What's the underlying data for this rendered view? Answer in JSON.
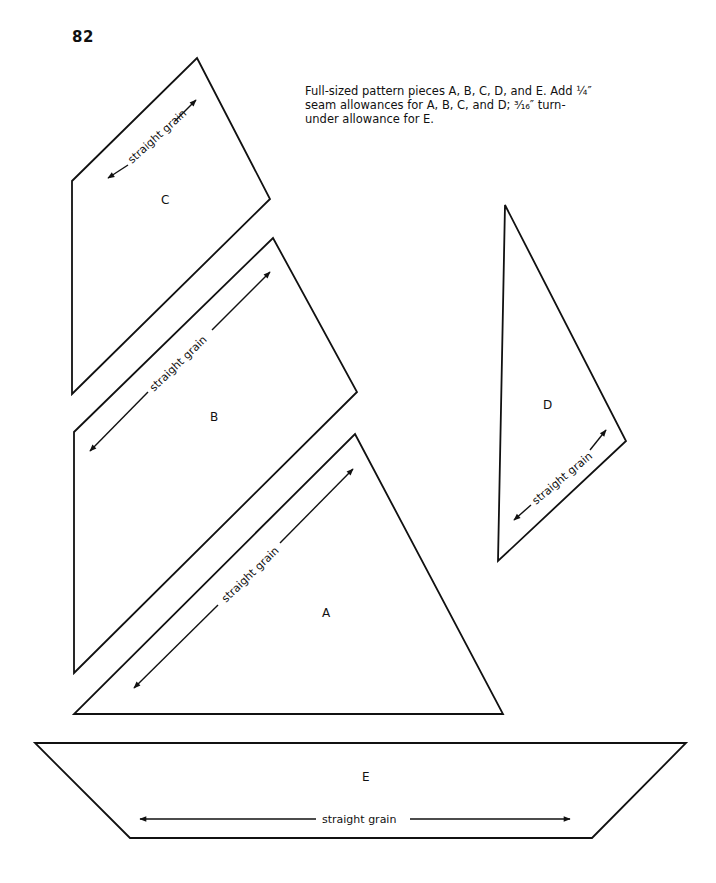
{
  "page": {
    "number": "82",
    "instructions": "Full-sized pattern pieces A, B, C, D, and E. Add ¼″ seam allowances for A, B, C, and D; ³⁄₁₆″ turn-under allowance for E."
  },
  "pieces": {
    "A": {
      "label": "A",
      "grain_label": "straight grain"
    },
    "B": {
      "label": "B",
      "grain_label": "straight grain"
    },
    "C": {
      "label": "C",
      "grain_label": "straight grain"
    },
    "D": {
      "label": "D",
      "grain_label": "straight grain"
    },
    "E": {
      "label": "E",
      "grain_label": "straight grain"
    }
  }
}
